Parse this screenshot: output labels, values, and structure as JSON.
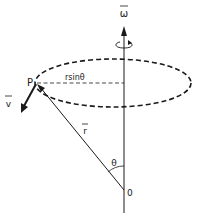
{
  "diagram": {
    "type": "physics-rotation-diagram",
    "labels": {
      "omega": "ω",
      "point": "P",
      "radius_projection": "rsinθ",
      "velocity": "v",
      "position_vector": "r",
      "angle": "θ",
      "origin": "0"
    },
    "colors": {
      "stroke": "#1a1a1a",
      "background": "#ffffff"
    }
  }
}
